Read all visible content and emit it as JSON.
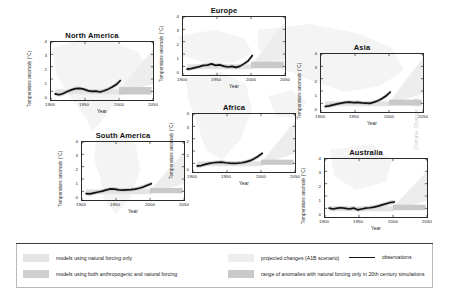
{
  "figure": {
    "watermark": "Climate Change 2007",
    "background_icon": "world-map-background"
  },
  "axes": {
    "ylabel": "Temperature anomaly (°C)",
    "xlabel": "Year",
    "yticks": [
      "4",
      "3",
      "2",
      "1",
      "0"
    ],
    "xticks": [
      "1900",
      "1950",
      "2000",
      "2050"
    ],
    "xlim": [
      1900,
      2050
    ],
    "ylim": [
      -0.7,
      4
    ]
  },
  "colors": {
    "observations": "#111111",
    "natural_only_band": "#e4e4e4",
    "anthropogenic_natural_band": "#cfcfcf",
    "projected_changes": "#ededed",
    "range_20th_century": "#c9c9c9",
    "axis": "#2b2b2b"
  },
  "legend": {
    "items": [
      {
        "swatch": "natural-forcing-swatch",
        "label": "models using natural forcing only",
        "color": "#e4e4e4"
      },
      {
        "swatch": "anthropogenic-natural-forcing-swatch",
        "label": "models using both anthropogenic and natural forcing",
        "color": "#cfcfcf"
      },
      {
        "swatch": "projected-changes-swatch",
        "label": "projected changes (A1B scenario)",
        "color": "#ededed"
      },
      {
        "swatch": "observations-line",
        "label": "observations",
        "color": "#111111"
      },
      {
        "swatch": "range-anomalies-swatch",
        "label": "range of anomalies with natural forcing only in 20th century simulations",
        "color": "#c9c9c9"
      }
    ]
  },
  "chart_data": {
    "type": "line",
    "xlabel": "Year",
    "ylabel": "Temperature anomaly (°C)",
    "xlim": [
      1900,
      2050
    ],
    "ylim": [
      -0.7,
      4
    ],
    "grid": false,
    "legend_position": "bottom",
    "x": [
      1906,
      1912,
      1918,
      1924,
      1930,
      1936,
      1942,
      1948,
      1954,
      1960,
      1966,
      1972,
      1978,
      1984,
      1990,
      1996,
      2002
    ],
    "panels": [
      {
        "name": "North America",
        "observations": [
          -0.2,
          -0.28,
          -0.18,
          -0.02,
          0.12,
          0.22,
          0.24,
          0.18,
          0.06,
          0.0,
          0.02,
          -0.05,
          0.05,
          0.18,
          0.35,
          0.55,
          0.88
        ],
        "projected_band": {
          "x_start": 2000,
          "x_end": 2050,
          "y_low": 0.6,
          "y_high": 3.4
        },
        "range_20th_band": {
          "x_start": 2000,
          "x_end": 2048,
          "y_low": -0.25,
          "y_high": 0.35
        }
      },
      {
        "name": "Europe",
        "observations": [
          -0.22,
          -0.18,
          -0.1,
          -0.02,
          0.08,
          0.1,
          0.2,
          0.08,
          0.12,
          0.02,
          -0.05,
          0.0,
          -0.08,
          0.02,
          0.22,
          0.45,
          0.88
        ],
        "projected_band": {
          "x_start": 2000,
          "x_end": 2050,
          "y_low": 0.7,
          "y_high": 3.6
        },
        "range_20th_band": {
          "x_start": 2000,
          "x_end": 2048,
          "y_low": -0.15,
          "y_high": 0.38
        }
      },
      {
        "name": "Asia",
        "observations": [
          -0.25,
          -0.2,
          -0.12,
          -0.04,
          0.02,
          0.08,
          0.1,
          0.06,
          0.08,
          0.04,
          0.02,
          0.0,
          0.1,
          0.22,
          0.4,
          0.62,
          0.92
        ],
        "projected_band": {
          "x_start": 2000,
          "x_end": 2050,
          "y_low": 0.8,
          "y_high": 3.7
        },
        "range_20th_band": {
          "x_start": 2000,
          "x_end": 2048,
          "y_low": -0.18,
          "y_high": 0.3
        }
      },
      {
        "name": "South America",
        "observations": [
          -0.18,
          -0.2,
          -0.12,
          -0.05,
          0.02,
          0.12,
          0.2,
          0.18,
          0.12,
          0.1,
          0.12,
          0.14,
          0.18,
          0.25,
          0.35,
          0.5,
          0.62
        ],
        "projected_band": {
          "x_start": 2000,
          "x_end": 2050,
          "y_low": 0.6,
          "y_high": 3.2
        },
        "range_20th_band": {
          "x_start": 2000,
          "x_end": 2048,
          "y_low": -0.15,
          "y_high": 0.28
        }
      },
      {
        "name": "Africa",
        "observations": [
          -0.2,
          -0.18,
          -0.08,
          0.0,
          0.05,
          0.08,
          0.1,
          0.05,
          0.02,
          0.0,
          0.02,
          0.05,
          0.12,
          0.22,
          0.38,
          0.58,
          0.82
        ],
        "projected_band": {
          "x_start": 2000,
          "x_end": 2050,
          "y_low": 0.8,
          "y_high": 3.4
        },
        "range_20th_band": {
          "x_start": 2000,
          "x_end": 2048,
          "y_low": -0.12,
          "y_high": 0.3
        }
      },
      {
        "name": "Australia",
        "observations": [
          0.02,
          -0.05,
          0.02,
          0.05,
          0.0,
          -0.05,
          0.02,
          -0.12,
          -0.05,
          0.02,
          0.05,
          0.1,
          0.18,
          0.28,
          0.38,
          0.48,
          0.52
        ],
        "projected_band": {
          "x_start": 2000,
          "x_end": 2050,
          "y_low": 0.6,
          "y_high": 3.0
        },
        "range_20th_band": {
          "x_start": 2000,
          "x_end": 2048,
          "y_low": -0.15,
          "y_high": 0.3
        }
      }
    ]
  }
}
